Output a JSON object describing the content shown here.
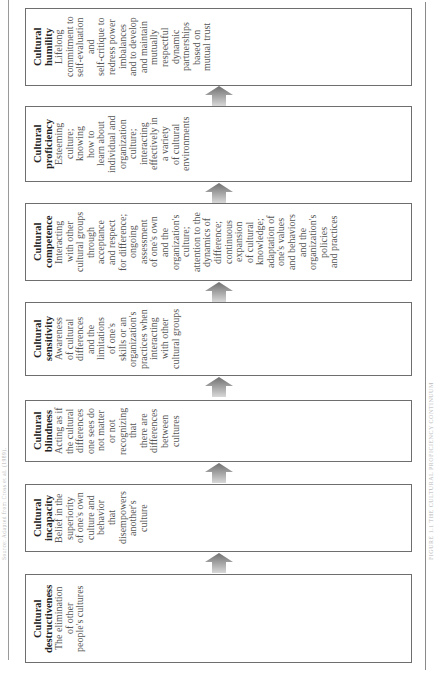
{
  "figure": {
    "title": "FIGURE 1.1 THE CULTURAL PROFICIENCY CONTINUUM",
    "source_note": "Source: Adapted from Cross et al. (1989)."
  },
  "stages": [
    {
      "term_lines": [
        "Cultural",
        "humility"
      ],
      "desc_lines": [
        "Lifelong",
        "commitment to",
        "self-evaluation",
        "and",
        "self-critique to",
        "redress power",
        "imbalances",
        "and to develop",
        "and maintain",
        "mutually",
        "respectful",
        "dynamic",
        "partnerships",
        "based on",
        "mutual trust"
      ]
    },
    {
      "term_lines": [
        "Cultural",
        "proficiency"
      ],
      "desc_lines": [
        "Esteeming",
        "culture;",
        "knowing",
        "how to",
        "learn about",
        "individual and",
        "organization",
        "culture;",
        "interacting",
        "effectively in",
        "a variety",
        "of cultural",
        "environments"
      ]
    },
    {
      "term_lines": [
        "Cultural",
        "competence"
      ],
      "desc_lines": [
        "Interacting",
        "with other",
        "cultural groups",
        "through",
        "acceptance",
        "and respect",
        "for difference;",
        "ongoing",
        "assessment",
        "of one's own",
        "and the",
        "organization's",
        "culture;",
        "attention to the",
        "dynamics of",
        "difference;",
        "continuous",
        "expansion",
        "of cultural",
        "knowledge;",
        "adaptation of",
        "one's values",
        "and behaviors",
        "and the",
        "organization's",
        "policies",
        "and practices"
      ]
    },
    {
      "term_lines": [
        "Cultural",
        "sensitivity"
      ],
      "desc_lines": [
        "Awareness",
        "of cultural",
        "differences",
        "and the",
        "limitations",
        "of one's",
        "skills or an",
        "organization's",
        "practices when",
        "interacting",
        "with other",
        "cultural groups"
      ]
    },
    {
      "term_lines": [
        "Cultural",
        "blindness"
      ],
      "desc_lines": [
        "Acting as if",
        "the cultural",
        "differences",
        "one sees do",
        "not matter",
        "or not",
        "recognizing",
        "that",
        "there are",
        "differences",
        "between",
        "cultures"
      ]
    },
    {
      "term_lines": [
        "Cultural",
        "incapacity"
      ],
      "desc_lines": [
        "Belief in the",
        "superiority",
        "of one's own",
        "culture and",
        "behavior",
        "that",
        "disempowers",
        "another's",
        "culture"
      ]
    },
    {
      "term_lines": [
        "Cultural",
        "destructiveness"
      ],
      "desc_lines": [
        "The elimination",
        "of other",
        "people's cultures"
      ]
    }
  ],
  "layout": {
    "boxes": [
      {
        "top": 8,
        "height": 78
      },
      {
        "top": 106,
        "height": 76
      },
      {
        "top": 203,
        "height": 78
      },
      {
        "top": 302,
        "height": 74
      },
      {
        "top": 400,
        "height": 62
      },
      {
        "top": 484,
        "height": 68
      },
      {
        "top": 574,
        "height": 89
      }
    ],
    "arrows": [
      86,
      183,
      282,
      377,
      463,
      553
    ]
  },
  "colors": {
    "border": "#6e6e6e",
    "arrow_top": "#6f6f6f",
    "arrow_bottom": "#d8d8d8"
  }
}
